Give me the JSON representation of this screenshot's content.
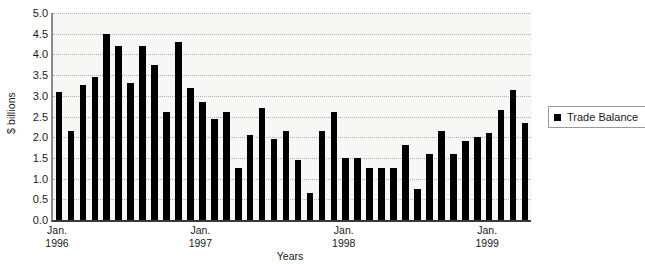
{
  "chart_data": {
    "type": "bar",
    "title": "",
    "xlabel": "Years",
    "ylabel": "$ billions",
    "ylim": [
      0.0,
      5.0
    ],
    "ytick_step": 0.5,
    "grid": true,
    "legend_position": "right",
    "series": [
      {
        "name": "Trade Balance",
        "color": "#000000",
        "values": [
          3.1,
          2.15,
          3.25,
          3.45,
          4.5,
          4.2,
          3.3,
          4.2,
          3.75,
          2.6,
          4.3,
          3.2,
          2.85,
          2.45,
          2.6,
          1.25,
          2.05,
          2.7,
          1.95,
          2.15,
          1.45,
          0.65,
          2.15,
          2.6,
          1.5,
          1.5,
          1.25,
          1.25,
          1.25,
          1.8,
          0.75,
          1.6,
          2.15,
          1.6,
          1.9,
          2.0,
          2.1,
          2.65,
          3.15,
          2.35
        ]
      }
    ],
    "ytick_labels": [
      "5.0",
      "4.5",
      "4.0",
      "3.5",
      "3.0",
      "2.5",
      "2.0",
      "1.5",
      "1.0",
      "0.5",
      "0.0"
    ],
    "ytick_values": [
      5.0,
      4.5,
      4.0,
      3.5,
      3.0,
      2.5,
      2.0,
      1.5,
      1.0,
      0.5,
      0.0
    ],
    "xtick_labels": [
      {
        "line1": "Jan.",
        "line2": "1996",
        "index": 0
      },
      {
        "line1": "Jan.",
        "line2": "1997",
        "index": 12
      },
      {
        "line1": "Jan.",
        "line2": "1998",
        "index": 24
      },
      {
        "line1": "Jan.",
        "line2": "1999",
        "index": 36
      }
    ]
  },
  "legend": {
    "entries": [
      {
        "label": "Trade Balance",
        "color": "#000000"
      }
    ]
  },
  "axes": {
    "y_title": "$ billions",
    "x_title": "Years"
  }
}
